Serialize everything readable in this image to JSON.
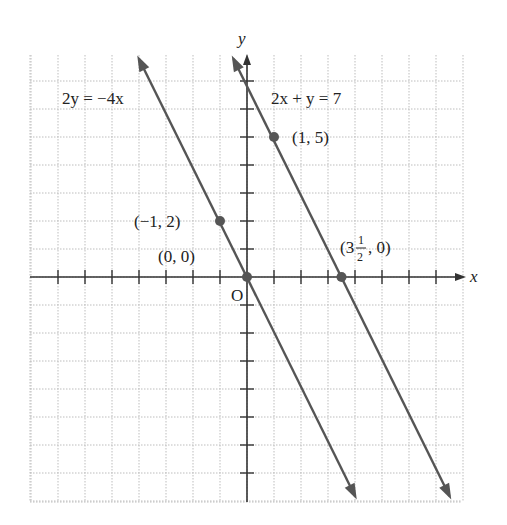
{
  "chart_data": {
    "type": "line",
    "title": "",
    "xlabel": "x",
    "ylabel": "y",
    "origin_label": "O",
    "xlim": [
      -8,
      8
    ],
    "ylim": [
      -8,
      8
    ],
    "grid": true,
    "series": [
      {
        "name": "2y = -4x",
        "equation": "y = -2x",
        "slope": -2,
        "intercept": 0,
        "points": [
          {
            "x": -1,
            "y": 2,
            "label": "(−1, 2)"
          },
          {
            "x": 0,
            "y": 0,
            "label": "(0, 0)"
          }
        ]
      },
      {
        "name": "2x + y = 7",
        "equation": "y = -2x + 7",
        "slope": -2,
        "intercept": 7,
        "points": [
          {
            "x": 1,
            "y": 5,
            "label": "(1, 5)"
          },
          {
            "x": 3.5,
            "y": 0,
            "label": "(3½, 0)"
          }
        ]
      }
    ]
  },
  "labels": {
    "x_axis": "x",
    "y_axis": "y",
    "origin": "O",
    "eq1": "2y = −4x",
    "eq2": "2x + y = 7",
    "p1": "(−1, 2)",
    "p2": "(0, 0)",
    "p3": "(1, 5)",
    "p4_open": "(3",
    "p4_num": "1",
    "p4_den": "2",
    "p4_close": ", 0)"
  },
  "colors": {
    "line": "#555555",
    "grid": "#bdbdbd",
    "axis": "#333333",
    "text": "#222222"
  }
}
